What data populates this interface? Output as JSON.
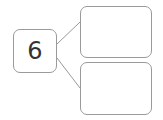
{
  "diagram": {
    "type": "number-bond",
    "whole": {
      "value": "6"
    },
    "parts": [
      {
        "value": ""
      },
      {
        "value": ""
      }
    ],
    "colors": {
      "border": "#9a9a9a",
      "text": "#333333",
      "background": "#ffffff"
    }
  }
}
